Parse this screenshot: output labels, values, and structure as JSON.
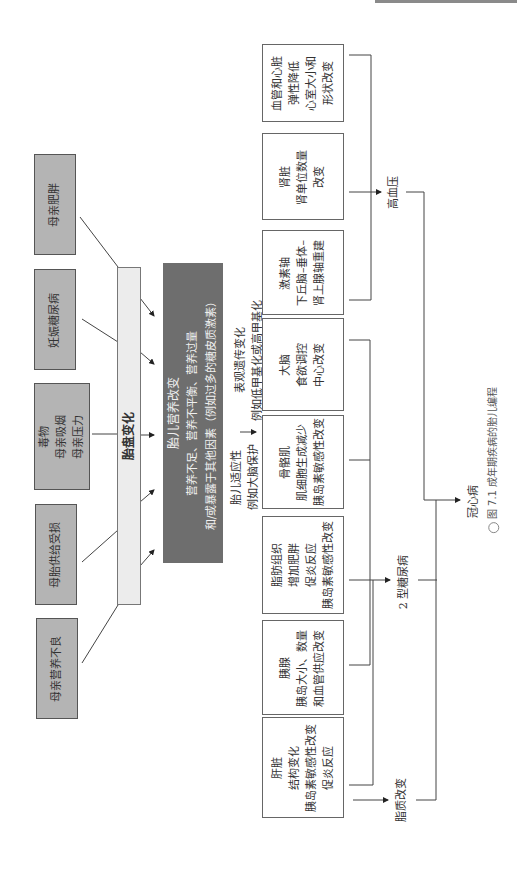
{
  "maternal_factors": [
    {
      "label": "母亲肥胖"
    },
    {
      "label": "妊娠糖尿病"
    },
    {
      "lines": [
        "毒物",
        "母亲吸烟",
        "母亲压力"
      ]
    },
    {
      "label": "母胎供给受损"
    },
    {
      "label": "母亲营养不良"
    }
  ],
  "placenta": {
    "label": "胎盘变化"
  },
  "fetal_nutrition": {
    "lines": [
      "胎儿营养改变",
      "营养不足、营养不平衡、营养过量",
      "和/或暴露于其他因素（例如过多的糖皮质激素）"
    ]
  },
  "adaptation": {
    "lines": [
      "胎儿适应性",
      "例如大脑保护"
    ]
  },
  "epigenetic": {
    "lines": [
      "表观遗传变化",
      "例如低甲基化或高甲基化"
    ]
  },
  "organs": [
    {
      "lines": [
        "血管和心脏",
        "弹性降低",
        "心室大小和",
        "形状改变"
      ]
    },
    {
      "lines": [
        "肾脏",
        "肾单位数量",
        "改变"
      ]
    },
    {
      "lines": [
        "激素轴",
        "下丘脑–垂体–",
        "肾上腺轴重建"
      ]
    },
    {
      "lines": [
        "大脑",
        "食欲调控",
        "中心改变"
      ]
    },
    {
      "lines": [
        "骨骼肌",
        "肌细胞生成减少",
        "胰岛素敏感性改变"
      ]
    },
    {
      "lines": [
        "脂肪组织",
        "增加肥胖",
        "促炎反应",
        "胰岛素敏感性改变"
      ]
    },
    {
      "lines": [
        "胰腺",
        "胰岛大小、数量",
        "和血管供应改变"
      ]
    },
    {
      "lines": [
        "肝脏",
        "结构变化",
        "胰岛素敏感性改变",
        "促炎反应"
      ]
    }
  ],
  "outcomes": {
    "hypertension": "高血压",
    "diabetes": "2 型糖尿病",
    "lipid": "脂质改变",
    "chd": "冠心病"
  },
  "caption": "图 7.1  成年期疾病的胎儿编程",
  "caption_icon": "bulb-icon"
}
